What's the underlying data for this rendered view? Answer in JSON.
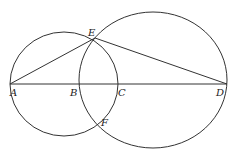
{
  "diagram": {
    "points": {
      "A": {
        "label": "A",
        "x": 10,
        "y": 84
      },
      "B": {
        "label": "B",
        "x": 79,
        "y": 84
      },
      "C": {
        "label": "C",
        "x": 118,
        "y": 84
      },
      "D": {
        "label": "D",
        "x": 227,
        "y": 84
      },
      "E": {
        "label": "E",
        "x": 95,
        "y": 38
      },
      "F": {
        "label": "F",
        "x": 97,
        "y": 123
      }
    },
    "circles": [
      {
        "name": "small-circle",
        "cx": 64,
        "cy": 84,
        "rx": 54,
        "ry": 52,
        "diameter": "AC"
      },
      {
        "name": "large-circle",
        "cx": 153,
        "cy": 80,
        "rx": 74,
        "ry": 68,
        "diameter": "BD"
      }
    ],
    "segments": [
      "AD",
      "AE",
      "ED"
    ],
    "colors": {
      "stroke": "#333333",
      "background": "#ffffff"
    }
  }
}
